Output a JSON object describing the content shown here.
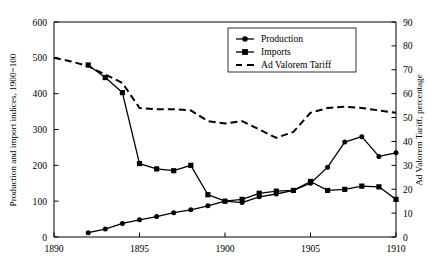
{
  "chart_data": {
    "type": "line",
    "title": "",
    "xlabel": "",
    "ylabel": "Production and import indices, 1900=100",
    "y2label": "Ad Valorem Tariff, percentage",
    "xlim": [
      1890,
      1910
    ],
    "ylim": [
      0,
      600
    ],
    "y2lim": [
      0,
      90
    ],
    "xticks": [
      1890,
      1895,
      1900,
      1905,
      1910
    ],
    "yticks": [
      0,
      100,
      200,
      300,
      400,
      500,
      600
    ],
    "y2ticks": [
      0,
      10,
      20,
      30,
      40,
      50,
      60,
      70,
      80,
      90
    ],
    "grid": false,
    "legend_position": "top-center-right",
    "legend_entries": [
      {
        "label": "Production",
        "marker": "circle",
        "line": "solid"
      },
      {
        "label": "Imports",
        "marker": "square",
        "line": "solid"
      },
      {
        "label": "Ad Valorem Tariff",
        "marker": "none",
        "line": "dashed"
      }
    ],
    "series": [
      {
        "name": "Production",
        "axis": "left",
        "marker": "circle",
        "line": "solid",
        "color": "#000000",
        "x": [
          1892,
          1893,
          1894,
          1895,
          1896,
          1897,
          1898,
          1899,
          1900,
          1901,
          1902,
          1903,
          1904,
          1905,
          1906,
          1907,
          1908,
          1909,
          1910
        ],
        "values": [
          12,
          22,
          38,
          48,
          57,
          68,
          76,
          87,
          100,
          96,
          112,
          120,
          130,
          150,
          195,
          265,
          280,
          225,
          235
        ]
      },
      {
        "name": "Imports",
        "axis": "left",
        "marker": "square",
        "line": "solid",
        "color": "#000000",
        "x": [
          1892,
          1893,
          1894,
          1895,
          1896,
          1897,
          1898,
          1899,
          1900,
          1901,
          1902,
          1903,
          1904,
          1905,
          1906,
          1907,
          1908,
          1909,
          1910
        ],
        "values": [
          480,
          445,
          403,
          205,
          190,
          185,
          200,
          118,
          100,
          105,
          122,
          128,
          130,
          155,
          130,
          133,
          142,
          140,
          105
        ]
      },
      {
        "name": "Ad Valorem Tariff",
        "axis": "right",
        "marker": "none",
        "line": "dashed",
        "color": "#000000",
        "x": [
          1890,
          1891,
          1892,
          1893,
          1894,
          1895,
          1896,
          1897,
          1898,
          1899,
          1900,
          1901,
          1902,
          1903,
          1904,
          1905,
          1906,
          1907,
          1908,
          1909,
          1910
        ],
        "values": [
          75.0,
          73.5,
          71.5,
          68.0,
          64.5,
          54.0,
          53.5,
          53.5,
          53.0,
          48.5,
          47.5,
          48.5,
          45.0,
          41.5,
          44.0,
          52.0,
          54.0,
          54.5,
          54.0,
          53.0,
          52.0
        ]
      }
    ]
  },
  "axes": {
    "left_title": "Production and import indices, 1900=100",
    "right_title": "Ad Valorem Tariff, percentage",
    "x_tick_labels": [
      "1890",
      "1895",
      "1900",
      "1905",
      "1910"
    ],
    "y_tick_labels": [
      "0",
      "100",
      "200",
      "300",
      "400",
      "500",
      "600"
    ],
    "y2_tick_labels": [
      "0",
      "10",
      "20",
      "30",
      "40",
      "50",
      "60",
      "70",
      "80",
      "90"
    ]
  },
  "legend": {
    "items": [
      {
        "label": "Production"
      },
      {
        "label": "Imports"
      },
      {
        "label": "Ad Valorem Tariff"
      }
    ]
  },
  "style": {
    "line_color": "#000000",
    "axis_color": "#000000",
    "background": "#ffffff"
  }
}
